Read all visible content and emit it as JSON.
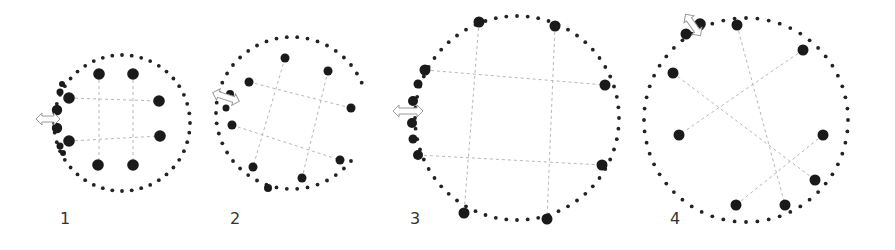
{
  "figure_title": "",
  "colors": {
    "dots": "#1a1a1a",
    "guides": "#b8b8b8",
    "arrow_outline": "#9a9a9a",
    "label": "#333333"
  },
  "panels": [
    {
      "label": "1",
      "description": "Closed circle of small dots with eight large nodes arranged in a square grid; several ring dots on the left enlarged near a horizontal double arrow",
      "icon": "double-arrow-horizontal-icon"
    },
    {
      "label": "2",
      "description": "Ring opened on the right side; eight large nodes rotated with tilted dashed guide grid; double arrow on left",
      "icon": "double-arrow-horizontal-icon"
    },
    {
      "label": "3",
      "description": "Larger closed circle; large nodes on the ring with axis-aligned dashed guides; enlarged dots clustered at left near double arrow",
      "icon": "double-arrow-horizontal-icon"
    },
    {
      "label": "4",
      "description": "Large circle with nodes rotated diagonally; dashed guides crossing diagonally; double arrow at top-left",
      "icon": "double-arrow-diagonal-icon"
    }
  ]
}
